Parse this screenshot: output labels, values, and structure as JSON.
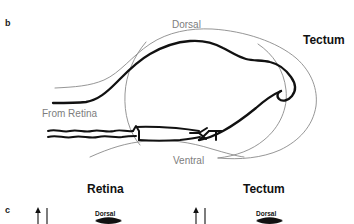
{
  "figure": {
    "panels": {
      "b": {
        "letter": "b"
      },
      "c": {
        "letter": "c"
      }
    },
    "panel_b": {
      "labels": {
        "dorsal": "Dorsal",
        "ventral": "Ventral",
        "tectum": "Tectum",
        "from_retina": "From Retina"
      },
      "colors": {
        "outline": "#8a8a8a",
        "axon": "#111111",
        "label_gray": "#7d7d7d",
        "label_black": "#111111",
        "background": "#ffffff"
      }
    },
    "panel_c": {
      "headings": {
        "retina": "Retina",
        "tectum": "Tectum"
      },
      "axis_labels": {
        "left_dorsal": "Dorsal",
        "right_dorsal": "Dorsal"
      },
      "colors": {
        "arrow": "#111111",
        "axis_line": "#111111",
        "blob": "#111111"
      }
    }
  }
}
